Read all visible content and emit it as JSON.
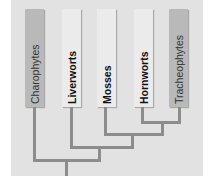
{
  "diagram": {
    "type": "cladogram",
    "colors": {
      "panel": "#e2e2e2",
      "outgroup_box": "#b9b9b9",
      "ingroup_box": "#ebebeb",
      "branch": "#8c8c8c"
    },
    "taxa": [
      {
        "label": "Charophytes",
        "group": "outgroup"
      },
      {
        "label": "Liverworts",
        "group": "ingroup"
      },
      {
        "label": "Mosses",
        "group": "ingroup"
      },
      {
        "label": "Hornworts",
        "group": "ingroup"
      },
      {
        "label": "Tracheophytes",
        "group": "outgroup"
      }
    ],
    "topology": "(Charophytes,(Liverworts,(Mosses,(Hornworts,Tracheophytes))))"
  }
}
